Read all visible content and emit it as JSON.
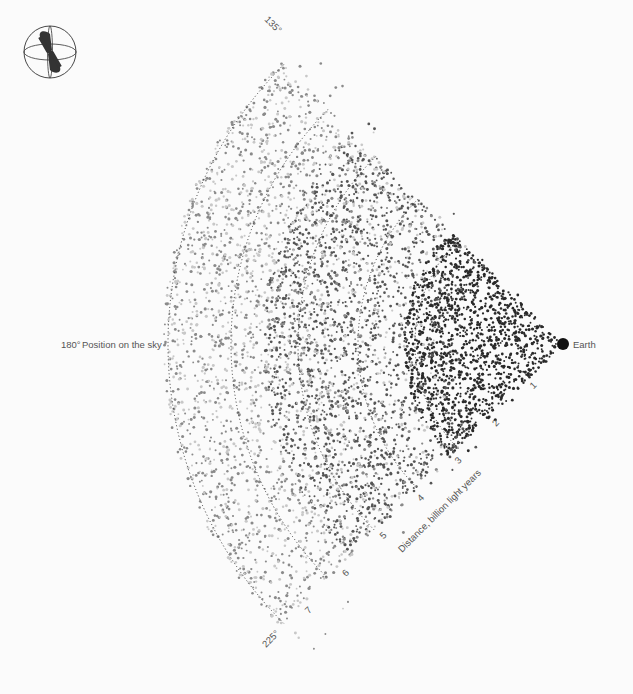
{
  "chart_data": {
    "type": "scatter",
    "observer": {
      "label": "Earth",
      "x": 563,
      "y": 344
    },
    "radial_axis": {
      "label": "Distance, billion light years",
      "ticks": [
        1,
        2,
        3,
        4,
        5,
        6,
        7
      ],
      "unit_px": 53
    },
    "angular_axis": {
      "label": "Position on the sky",
      "ticks": [
        "135°",
        "180°",
        "225°"
      ],
      "range_deg": [
        135,
        225
      ]
    },
    "arcs": [
      {
        "radius_px": 148,
        "style": "dotted"
      },
      {
        "radius_px": 205,
        "style": "dotted"
      },
      {
        "radius_px": 265,
        "style": "dotted"
      },
      {
        "radius_px": 332,
        "style": "dotted"
      },
      {
        "radius_px": 395,
        "style": "dotted"
      }
    ],
    "series": [
      {
        "name": "nearby galaxies",
        "color": "#2a2a2a",
        "radius_range": [
          0,
          160
        ],
        "count": 1400
      },
      {
        "name": "mid-distance galaxies",
        "color": "#555555",
        "radius_range": [
          100,
          300
        ],
        "count": 1500
      },
      {
        "name": "far galaxies",
        "color": "#8a8a8a",
        "radius_range": [
          150,
          400
        ],
        "count": 1400
      },
      {
        "name": "faint galaxies",
        "color": "#c8c8c8",
        "radius_range": [
          120,
          400
        ],
        "count": 1200
      }
    ],
    "grid": false,
    "legend": "none"
  },
  "labels": {
    "earth": "Earth",
    "position": "Position on the sky",
    "angle_180": "180°",
    "angle_135": "135°",
    "angle_225": "225°",
    "distance_axis": "Distance, billion light years",
    "ticks": [
      "1",
      "2",
      "3",
      "4",
      "5",
      "6",
      "7"
    ]
  },
  "icon": {
    "name": "globe-orientation-icon"
  }
}
